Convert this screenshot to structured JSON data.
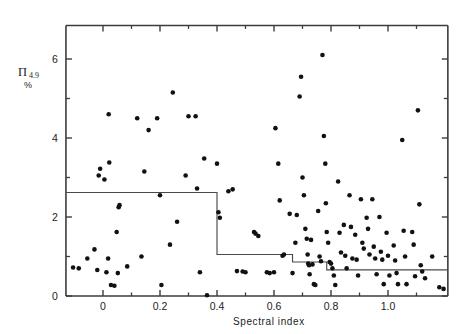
{
  "figure": {
    "background": "#ffffff",
    "ink_color": "#111111",
    "axis_color": "#3c3c3c",
    "step_color": "#4a4a4a"
  },
  "labels": {
    "y_symbol": "Π",
    "y_subscript": "4.9",
    "y_percent": "%",
    "x_axis_title": "Spectral index",
    "caption": ""
  },
  "chart_data": {
    "type": "scatter",
    "title": "",
    "xlabel": "Spectral index",
    "ylabel": "Π 4.9 %",
    "xlim": [
      -0.13,
      1.21
    ],
    "ylim": [
      0,
      6.85
    ],
    "grid": false,
    "legend": null,
    "x_ticks": [
      0,
      0.2,
      0.4,
      0.6,
      0.8,
      1.0
    ],
    "x_tick_labels": [
      "0",
      "0.2",
      "0.4",
      "0.6",
      "0.8",
      "1.0"
    ],
    "x_minor_ticks": [
      0.1,
      0.3,
      0.5,
      0.7,
      0.9,
      1.1
    ],
    "y_ticks": [
      0,
      2,
      4,
      6
    ],
    "y_tick_labels": [
      "0",
      "2",
      "4",
      "6"
    ],
    "y_minor_ticks": [
      1,
      3,
      5
    ],
    "marker": "filled-circle",
    "marker_size_px": 4.6,
    "points": [
      [
        -0.105,
        0.72
      ],
      [
        -0.085,
        0.7
      ],
      [
        -0.055,
        0.95
      ],
      [
        -0.03,
        1.18
      ],
      [
        -0.02,
        0.66
      ],
      [
        -0.015,
        3.05
      ],
      [
        -0.01,
        3.22
      ],
      [
        0.005,
        2.95
      ],
      [
        0.012,
        0.6
      ],
      [
        0.018,
        0.95
      ],
      [
        0.02,
        4.6
      ],
      [
        0.022,
        3.38
      ],
      [
        0.028,
        0.28
      ],
      [
        0.04,
        0.26
      ],
      [
        0.048,
        1.62
      ],
      [
        0.052,
        0.58
      ],
      [
        0.055,
        2.25
      ],
      [
        0.058,
        2.3
      ],
      [
        0.12,
        4.5
      ],
      [
        0.145,
        3.15
      ],
      [
        0.16,
        4.2
      ],
      [
        0.19,
        4.5
      ],
      [
        0.2,
        2.55
      ],
      [
        0.205,
        0.28
      ],
      [
        0.235,
        1.3
      ],
      [
        0.245,
        5.15
      ],
      [
        0.26,
        1.88
      ],
      [
        0.29,
        3.05
      ],
      [
        0.3,
        4.55
      ],
      [
        0.325,
        4.55
      ],
      [
        0.33,
        2.72
      ],
      [
        0.34,
        0.6
      ],
      [
        0.355,
        3.48
      ],
      [
        0.365,
        0.02
      ],
      [
        0.4,
        3.35
      ],
      [
        0.405,
        2.12
      ],
      [
        0.41,
        1.98
      ],
      [
        0.47,
        0.63
      ],
      [
        0.49,
        0.62
      ],
      [
        0.53,
        1.62
      ],
      [
        0.535,
        1.58
      ],
      [
        0.545,
        1.52
      ],
      [
        0.575,
        0.6
      ],
      [
        0.585,
        0.58
      ],
      [
        0.6,
        0.6
      ],
      [
        0.605,
        4.25
      ],
      [
        0.615,
        3.35
      ],
      [
        0.63,
        1.02
      ],
      [
        0.635,
        1.05
      ],
      [
        0.665,
        0.58
      ],
      [
        0.675,
        1.35
      ],
      [
        0.69,
        5.05
      ],
      [
        0.695,
        5.55
      ],
      [
        0.7,
        3.0
      ],
      [
        0.705,
        2.55
      ],
      [
        0.71,
        1.7
      ],
      [
        0.715,
        1.45
      ],
      [
        0.718,
        1.05
      ],
      [
        0.72,
        0.82
      ],
      [
        0.723,
        0.78
      ],
      [
        0.725,
        0.55
      ],
      [
        0.73,
        1.42
      ],
      [
        0.735,
        0.8
      ],
      [
        0.74,
        0.3
      ],
      [
        0.745,
        0.28
      ],
      [
        0.755,
        2.15
      ],
      [
        0.76,
        1.0
      ],
      [
        0.765,
        0.88
      ],
      [
        0.77,
        6.1
      ],
      [
        0.775,
        4.05
      ],
      [
        0.78,
        3.35
      ],
      [
        0.782,
        2.35
      ],
      [
        0.785,
        1.62
      ],
      [
        0.79,
        1.35
      ],
      [
        0.795,
        0.86
      ],
      [
        0.8,
        0.82
      ],
      [
        0.805,
        0.7
      ],
      [
        0.81,
        0.52
      ],
      [
        0.815,
        0.28
      ],
      [
        0.825,
        2.9
      ],
      [
        0.83,
        1.6
      ],
      [
        0.835,
        1.1
      ],
      [
        0.845,
        1.8
      ],
      [
        0.85,
        1.02
      ],
      [
        0.855,
        0.7
      ],
      [
        0.865,
        2.55
      ],
      [
        0.87,
        1.75
      ],
      [
        0.875,
        0.95
      ],
      [
        0.885,
        1.55
      ],
      [
        0.89,
        0.92
      ],
      [
        0.895,
        0.52
      ],
      [
        0.905,
        2.45
      ],
      [
        0.91,
        1.35
      ],
      [
        0.915,
        1.2
      ],
      [
        0.925,
        1.98
      ],
      [
        0.93,
        1.7
      ],
      [
        0.935,
        1.05
      ],
      [
        0.945,
        2.45
      ],
      [
        0.95,
        1.25
      ],
      [
        0.955,
        0.95
      ],
      [
        0.96,
        0.55
      ],
      [
        0.97,
        2.0
      ],
      [
        0.975,
        1.12
      ],
      [
        0.98,
        0.92
      ],
      [
        0.985,
        0.3
      ],
      [
        0.995,
        1.6
      ],
      [
        1.0,
        1.02
      ],
      [
        1.005,
        0.52
      ],
      [
        1.02,
        1.28
      ],
      [
        1.025,
        0.9
      ],
      [
        1.03,
        0.58
      ],
      [
        1.035,
        0.3
      ],
      [
        1.05,
        3.95
      ],
      [
        1.055,
        1.65
      ],
      [
        1.06,
        1.0
      ],
      [
        1.065,
        0.3
      ],
      [
        1.085,
        1.62
      ],
      [
        1.09,
        1.3
      ],
      [
        1.095,
        0.5
      ],
      [
        1.105,
        4.7
      ],
      [
        1.11,
        2.32
      ],
      [
        1.115,
        0.78
      ],
      [
        1.12,
        0.62
      ],
      [
        1.13,
        0.45
      ],
      [
        1.155,
        1.0
      ],
      [
        1.18,
        0.22
      ],
      [
        1.195,
        0.18
      ],
      [
        0.455,
        2.7
      ],
      [
        0.44,
        2.65
      ],
      [
        0.135,
        1.0
      ],
      [
        0.085,
        0.75
      ],
      [
        0.62,
        2.42
      ],
      [
        0.655,
        2.08
      ],
      [
        0.68,
        2.05
      ],
      [
        0.5,
        0.6
      ]
    ],
    "step_line": {
      "description": "upper-envelope step function",
      "segments": [
        {
          "x_start": -0.13,
          "x_end": 0.4,
          "y": 2.62
        },
        {
          "x_start": 0.4,
          "x_end": 0.665,
          "y": 1.05
        },
        {
          "x_start": 0.665,
          "x_end": 0.785,
          "y": 0.86
        },
        {
          "x_start": 0.785,
          "x_end": 1.21,
          "y": 0.66
        }
      ]
    }
  }
}
